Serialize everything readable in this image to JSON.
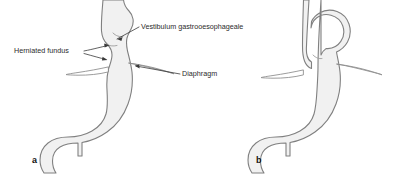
{
  "figure": {
    "background_color": "#ffffff",
    "organ_fill_color": "#f1f1f1",
    "organ_stroke_color": "#808080",
    "leader_line_color": "#3a3a3a",
    "label_text_color": "#2b2b2b"
  },
  "labels": [
    {
      "id": "vestibulum",
      "text": "Vestibulum gastrooesophageale",
      "x": 141,
      "y": 29,
      "anchor": "start"
    },
    {
      "id": "herniated_fundus",
      "text": "Herniated fundus",
      "x": 14,
      "y": 53,
      "anchor": "start"
    },
    {
      "id": "diaphragm",
      "text": "Diaphragm",
      "x": 182,
      "y": 76,
      "anchor": "start"
    }
  ],
  "panels": [
    {
      "id": "panel-a",
      "label": "a",
      "x": 32,
      "y": 163
    },
    {
      "id": "panel-b",
      "label": "b",
      "x": 256,
      "y": 163
    }
  ]
}
